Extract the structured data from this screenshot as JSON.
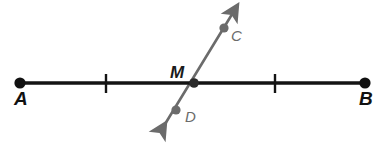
{
  "figure": {
    "type": "geometry-diagram",
    "width": 383,
    "height": 158,
    "background_color": "#ffffff",
    "colors": {
      "line_ab": "#141414",
      "line_cd": "#6b6b6b",
      "endpoint_dot": "#111111",
      "ray_dot": "#6b6b6b",
      "tick_mark": "#141414"
    },
    "labels": {
      "a": "A",
      "b": "B",
      "m": "M",
      "c": "C",
      "d": "D"
    },
    "points": {
      "a": {
        "label": "A",
        "x": 20,
        "y": 83,
        "dot_radius": 5.5,
        "label_x": 14,
        "label_y": 104
      },
      "b": {
        "label": "B",
        "x": 365,
        "y": 83,
        "dot_radius": 5.5,
        "label_x": 359,
        "label_y": 104
      },
      "m": {
        "label": "M",
        "x": 194,
        "y": 83,
        "dot_radius": 4.5,
        "label_x": 170,
        "label_y": 78
      },
      "c": {
        "label": "C",
        "x": 224,
        "y": 28,
        "dot_radius": 4.5,
        "label_x": 231,
        "label_y": 40
      },
      "d": {
        "label": "D",
        "x": 176,
        "y": 110,
        "dot_radius": 4.5,
        "label_x": 184,
        "label_y": 121
      }
    },
    "segments": {
      "line_ab": {
        "name": "line-ab",
        "x1": 20,
        "y1": 83,
        "x2": 365,
        "y2": 83,
        "stroke_width": 3.4
      },
      "line_cd": {
        "name": "line-cd",
        "x1": 159,
        "y1": 134,
        "x2": 237,
        "y2": 6,
        "stroke_width": 2.6
      }
    },
    "tick_marks": [
      {
        "name": "tick-left",
        "x": 106,
        "y1": 74,
        "y2": 93,
        "stroke_width": 2.4
      },
      {
        "name": "tick-right",
        "x": 275,
        "y1": 74,
        "y2": 93,
        "stroke_width": 2.4
      }
    ],
    "arrowheads": [
      {
        "name": "arrowhead-up-right",
        "tip_x": 237,
        "tip_y": 6,
        "direction": "up-right"
      },
      {
        "name": "arrowhead-down-left",
        "tip_x": 159,
        "tip_y": 134,
        "direction": "down-left"
      }
    ]
  }
}
